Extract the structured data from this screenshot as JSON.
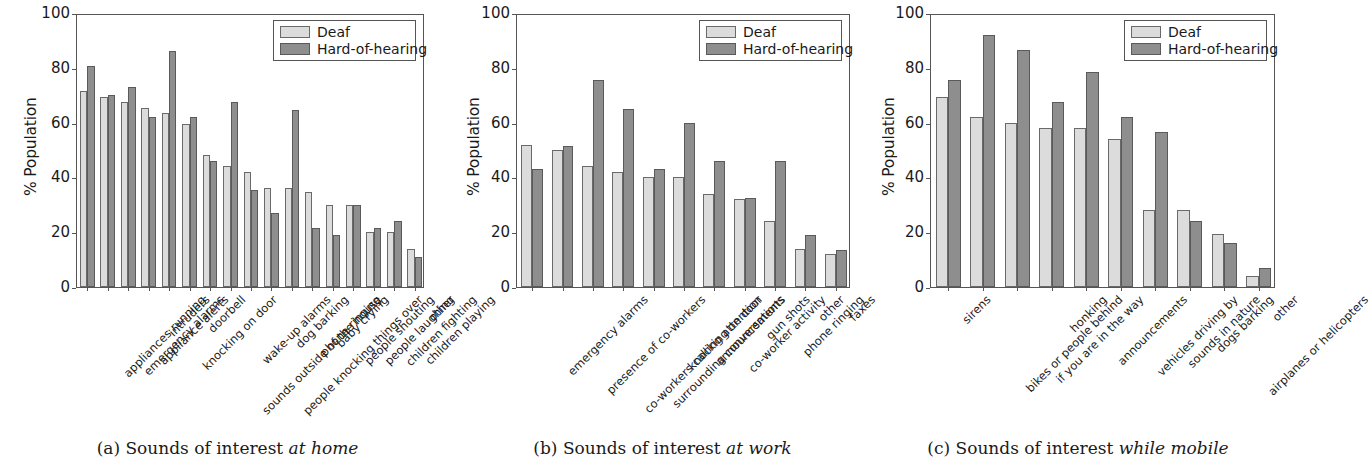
{
  "figure": {
    "y_axis_label": "% Population",
    "y_ticks": [
      "0",
      "20",
      "40",
      "60",
      "80",
      "100"
    ],
    "legend": {
      "deaf_label": "Deaf",
      "hoh_label": "Hard-of-hearing",
      "deaf_color": "#dcdcdc",
      "hoh_color": "#8e8e8e"
    },
    "captions": {
      "a_prefix": "(a) Sounds of interest ",
      "a_emph": "at home",
      "b_prefix": "(b) Sounds of interest ",
      "b_emph": "at work",
      "c_prefix": "(c) Sounds of interest ",
      "c_emph": "while mobile"
    }
  },
  "chart_data": [
    {
      "type": "bar",
      "panel": "a",
      "title": "(a) Sounds of interest at home",
      "xlabel": "",
      "ylabel": "% Population",
      "ylim": [
        0,
        100
      ],
      "yticks": [
        0,
        20,
        40,
        60,
        80,
        100
      ],
      "grid": false,
      "legend_position": "upper right",
      "categories": [
        "appliances running",
        "emergency alarms",
        "appliance alerts",
        "intruders",
        "knocking on door",
        "doorbell",
        "sounds outside of the house",
        "wake-up alarms",
        "people knocking things over",
        "dog barking",
        "phone ringing",
        "baby crying",
        "people shouting",
        "people laughing",
        "children fighting",
        "children playing",
        "other"
      ],
      "series": [
        {
          "name": "Deaf",
          "values": [
            71.5,
            69.5,
            67.5,
            65.5,
            63.5,
            59.5,
            48,
            44,
            42,
            36,
            36,
            34.5,
            30,
            30,
            20,
            20,
            14
          ]
        },
        {
          "name": "Hard-of-hearing",
          "values": [
            80.5,
            70,
            73,
            62,
            86,
            62,
            46,
            67.5,
            35.5,
            27,
            64.5,
            21.5,
            19,
            30,
            21.5,
            24,
            11
          ]
        }
      ]
    },
    {
      "type": "bar",
      "panel": "b",
      "title": "(b) Sounds of interest at work",
      "xlabel": "",
      "ylabel": "% Population",
      "ylim": [
        0,
        100
      ],
      "yticks": [
        0,
        20,
        40,
        60,
        80,
        100
      ],
      "grid": false,
      "legend_position": "upper right",
      "categories": [
        "emergency alarms",
        "presence of co-workers",
        "co-workers calling attention",
        "surrounding conversations",
        "knocking on door",
        "announcements",
        "co-worker activity",
        "gun shots",
        "phone ringing",
        "other",
        "faxes"
      ],
      "series": [
        {
          "name": "Deaf",
          "values": [
            52,
            50,
            44,
            42,
            40,
            40,
            34,
            32,
            24,
            14,
            12
          ]
        },
        {
          "name": "Hard-of-hearing",
          "values": [
            43,
            51.5,
            75.5,
            65,
            43,
            60,
            46,
            32.5,
            46,
            19,
            13.5
          ]
        }
      ]
    },
    {
      "type": "bar",
      "panel": "c",
      "title": "(c) Sounds of interest while mobile",
      "xlabel": "",
      "ylabel": "% Population",
      "ylim": [
        0,
        100
      ],
      "yticks": [
        0,
        20,
        40,
        60,
        80,
        100
      ],
      "grid": false,
      "legend_position": "upper right",
      "categories": [
        "sirens",
        "bikes or people behind",
        "if you are in the way",
        "honking",
        "announcements",
        "vehicles driving by",
        "sounds in nature",
        "dogs barking",
        "airplanes or helicopters",
        "other"
      ],
      "series": [
        {
          "name": "Deaf",
          "values": [
            69.5,
            62,
            60,
            58,
            58,
            54,
            28,
            28,
            19.5,
            4
          ]
        },
        {
          "name": "Hard-of-hearing",
          "values": [
            75.5,
            92,
            86.5,
            67.5,
            78.5,
            62,
            56.5,
            24,
            16,
            7
          ]
        }
      ]
    }
  ]
}
